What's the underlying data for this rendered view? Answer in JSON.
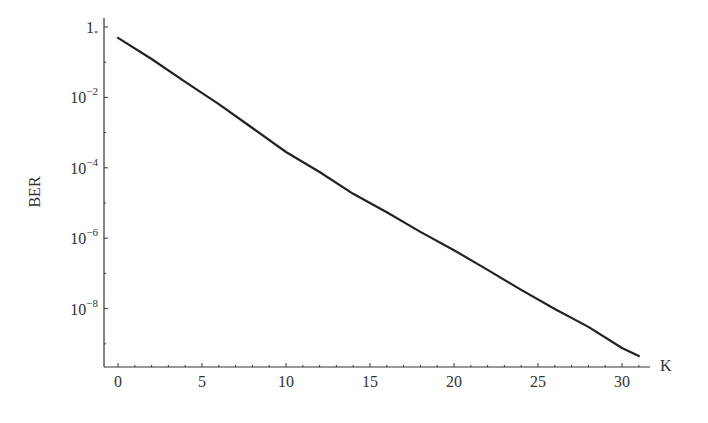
{
  "chart_data": {
    "type": "line",
    "title": "",
    "xlabel": "K",
    "ylabel": "BER",
    "yscale": "log",
    "xlim": [
      -0.8,
      31.5
    ],
    "ylim_log10": [
      -9.7,
      0.2
    ],
    "grid": false,
    "legend": null,
    "x_ticks": [
      0,
      5,
      10,
      15,
      20,
      25,
      30
    ],
    "x_tick_labels": [
      "0",
      "5",
      "10",
      "15",
      "20",
      "25",
      "30"
    ],
    "y_ticks_log10": [
      0,
      -2,
      -4,
      -6,
      -8
    ],
    "y_tick_labels": [
      {
        "base": "1.",
        "exp": ""
      },
      {
        "base": "10",
        "exp": "−2"
      },
      {
        "base": "10",
        "exp": "−4"
      },
      {
        "base": "10",
        "exp": "−6"
      },
      {
        "base": "10",
        "exp": "−8"
      }
    ],
    "series": [
      {
        "name": "BER",
        "color": "#222222",
        "x": [
          0,
          2,
          4,
          6,
          8,
          10,
          12,
          14,
          16,
          18,
          20,
          22,
          24,
          26,
          28,
          30,
          31
        ],
        "log10_y": [
          -0.31,
          -0.91,
          -1.56,
          -2.19,
          -2.87,
          -3.55,
          -4.12,
          -4.74,
          -5.26,
          -5.82,
          -6.34,
          -6.9,
          -7.47,
          -8.01,
          -8.52,
          -9.12,
          -9.35
        ],
        "values": [
          0.49,
          0.12,
          0.028,
          0.0065,
          0.0013,
          0.00028,
          7.6e-05,
          1.8e-05,
          5.5e-06,
          1.5e-06,
          4.6e-07,
          1.3e-07,
          3.4e-08,
          9.8e-09,
          3e-09,
          7.6e-10,
          4.5e-10
        ]
      }
    ]
  },
  "layout": {
    "x0_px": 118,
    "px_per_k": 16.8,
    "y0_px": 27,
    "px_per_decade": 35.2,
    "axis_left_px": 104,
    "axis_bottom_px": 367,
    "axis_right_px": 650,
    "axis_top_px": 18
  }
}
